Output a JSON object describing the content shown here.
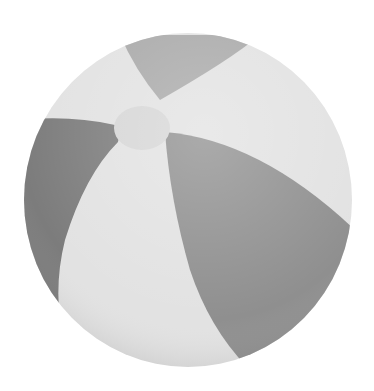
{
  "image": {
    "subject": "beach ball",
    "background": "#ffffff",
    "colors": {
      "light_panel": "#e2e2e2",
      "mid_panel": "#a9a9a9",
      "dark_panel": "#7c7c7c",
      "hub": "#d6d6d6"
    }
  }
}
